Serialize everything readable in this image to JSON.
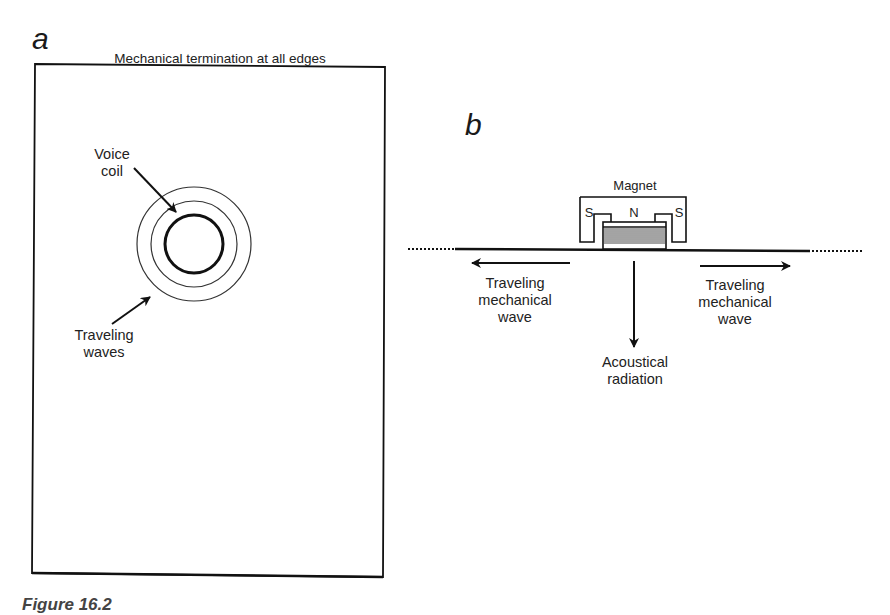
{
  "figure": {
    "caption_partial": "Figure 16.2",
    "panel_a": {
      "letter": "a",
      "top_label": "Mechanical termination at all edges",
      "voice_coil_label_line1": "Voice",
      "voice_coil_label_line2": "coil",
      "waves_label_line1": "Traveling",
      "waves_label_line2": "waves"
    },
    "panel_b": {
      "letter": "b",
      "magnet_label": "Magnet",
      "pole_left": "S",
      "pole_center": "N",
      "pole_right": "S",
      "left_wave_line1": "Traveling",
      "left_wave_line2": "mechanical",
      "left_wave_line3": "wave",
      "right_wave_line1": "Traveling",
      "right_wave_line2": "mechanical",
      "right_wave_line3": "wave",
      "radiation_line1": "Acoustical",
      "radiation_line2": "radiation"
    }
  }
}
